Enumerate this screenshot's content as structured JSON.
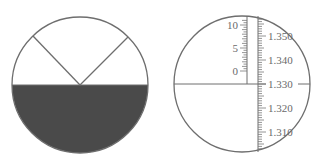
{
  "figure": {
    "left_view": {
      "description": "Circular field of view, lower half shaded dark, upper half light with V-shaped crosshair lines meeting at center",
      "center": [
        80,
        85
      ],
      "radius": 68,
      "fill_dark": "#4a4a4a",
      "line_color": "#6e6e6e",
      "v_lines": [
        [
          33,
          36
        ],
        [
          128,
          37
        ]
      ]
    },
    "right_view": {
      "description": "Circular field of view with horizontal crosshair and dual vertical scales",
      "center": [
        242,
        84
      ],
      "radius": 68,
      "line_color": "#6e6e6e",
      "left_scale": {
        "labels": [
          "10",
          "5",
          "0"
        ],
        "values": [
          10,
          5,
          0
        ],
        "min": 0,
        "max": 10
      },
      "right_scale": {
        "labels": [
          "1.350",
          "1.340",
          "1.330",
          "1.320",
          "1.310"
        ],
        "values": [
          1.35,
          1.34,
          1.33,
          1.32,
          1.31
        ],
        "min": 1.305,
        "max": 1.355
      }
    }
  }
}
